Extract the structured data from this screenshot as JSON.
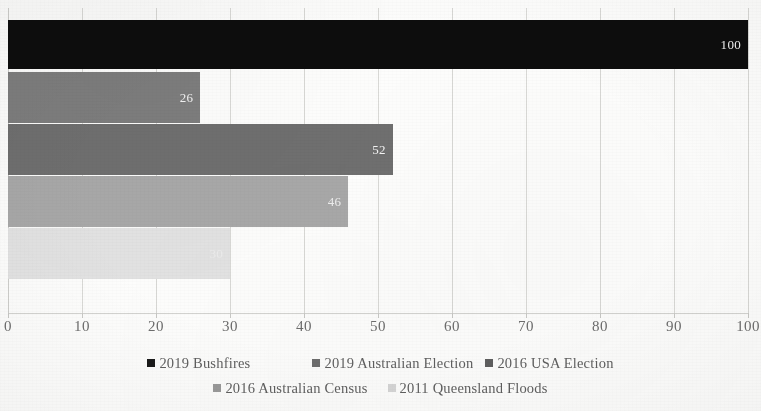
{
  "chart_data": {
    "type": "bar",
    "orientation": "horizontal",
    "title": "",
    "subtitle": "",
    "xlabel": "",
    "ylabel": "",
    "xlim": [
      0,
      100
    ],
    "grid": true,
    "grid_axis": "x",
    "legend_position": "bottom",
    "categories": [
      "2019 Bushfires",
      "2019 Australian Election",
      "2016 USA Election",
      "2016 Australian Census",
      "2011 Queensland Floods"
    ],
    "values": [
      100,
      26,
      52,
      46,
      30
    ],
    "data_labels": [
      "100",
      "26",
      "52",
      "46",
      "30"
    ],
    "bar_colors": [
      "#0d0d0d",
      "#7d7d7d",
      "#6f6f6f",
      "#a8a8a8",
      "#e2e2e2"
    ],
    "label_colors": [
      "#f2f2f2",
      "#f4f4f4",
      "#f4f4f4",
      "#f6f6f6",
      "#f2f2f2"
    ],
    "xticks": [
      0,
      10,
      20,
      30,
      40,
      50,
      60,
      70,
      80,
      90,
      100
    ],
    "xtick_labels": [
      "0",
      "10",
      "20",
      "30",
      "40",
      "50",
      "60",
      "70",
      "80",
      "90",
      "100"
    ]
  },
  "axis": {
    "tick_labels": [
      "0",
      "10",
      "20",
      "30",
      "40",
      "50",
      "60",
      "70",
      "80",
      "90",
      "100"
    ]
  },
  "series": [
    {
      "label": "2019 Bushfires",
      "value": "100",
      "color": "#0d0d0d"
    },
    {
      "label": "2019 Australian Election",
      "value": "26",
      "color": "#7d7d7d"
    },
    {
      "label": "2016 USA Election",
      "value": "52",
      "color": "#6f6f6f"
    },
    {
      "label": "2016 Australian Census",
      "value": "46",
      "color": "#a8a8a8"
    },
    {
      "label": "2011 Queensland Floods",
      "value": "30",
      "color": "#e2e2e2"
    }
  ],
  "legend": {
    "row1": [
      {
        "label": "2019 Bushfires",
        "color": "#1a1a1a"
      },
      {
        "label": "2019 Australian Election",
        "color": "#6e6e6e"
      },
      {
        "label": "2016 USA Election",
        "color": "#5f5f5f"
      }
    ],
    "row2": [
      {
        "label": "2016 Australian Census",
        "color": "#9a9a9a"
      },
      {
        "label": "2011 Queensland Floods",
        "color": "#d6d6d6"
      }
    ]
  }
}
